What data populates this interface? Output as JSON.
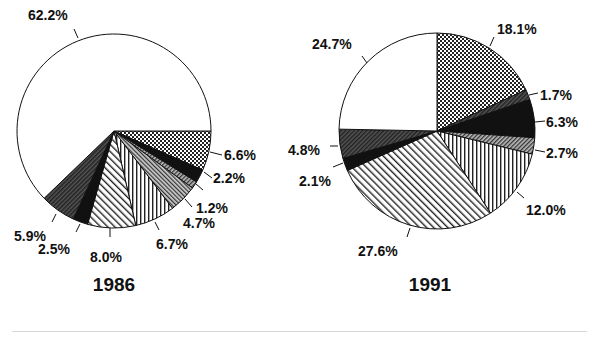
{
  "chart_data": [
    {
      "type": "pie",
      "title": "1986",
      "center": [
        114,
        131
      ],
      "radius": 97,
      "start_angle_deg": 0,
      "direction": "clockwise-from-3-oclock",
      "slices": [
        {
          "label": "6.6%",
          "value": 6.6,
          "pattern": "crosshatch",
          "label_pos": [
            224,
            160
          ],
          "tick": [
            [
              210,
              152
            ],
            [
              222,
              155
            ]
          ]
        },
        {
          "label": "2.2%",
          "value": 2.2,
          "pattern": "black",
          "label_pos": [
            213,
            183
          ],
          "tick": [
            [
              204,
              172
            ],
            [
              212,
              178
            ]
          ]
        },
        {
          "label": "1.2%",
          "value": 1.2,
          "pattern": "dense-diag",
          "label_pos": [
            196,
            213
          ],
          "tick": [
            [
              196,
              184
            ],
            [
              203,
              190
            ]
          ]
        },
        {
          "label": "4.7%",
          "value": 4.7,
          "pattern": "gray-diag",
          "label_pos": [
            183,
            228
          ],
          "tick": [
            [
              185,
              199
            ],
            [
              192,
              207
            ]
          ]
        },
        {
          "label": "6.7%",
          "value": 6.7,
          "pattern": "vertical",
          "label_pos": [
            156,
            249
          ],
          "tick": [
            [
              155,
              222
            ],
            [
              159,
              230
            ]
          ]
        },
        {
          "label": "8.0%",
          "value": 8.0,
          "pattern": "diagonal",
          "label_pos": [
            90,
            262
          ],
          "tick": [
            [
              110,
              228
            ],
            [
              110,
              237
            ]
          ]
        },
        {
          "label": "2.5%",
          "value": 2.5,
          "pattern": "black",
          "label_pos": [
            38,
            254
          ],
          "tick": [
            [
              80,
              224
            ],
            [
              76,
              232
            ]
          ]
        },
        {
          "label": "5.9%",
          "value": 5.9,
          "pattern": "dark-gray",
          "label_pos": [
            14,
            241
          ],
          "tick": [
            [
              56,
              214
            ],
            [
              52,
              222
            ]
          ]
        },
        {
          "label": "62.2%",
          "value": 62.2,
          "pattern": "white",
          "label_pos": [
            28,
            20
          ],
          "tick": [
            [
              74,
              29
            ],
            [
              78,
              38
            ]
          ]
        }
      ]
    },
    {
      "type": "pie",
      "title": "1991",
      "center": [
        437,
        131
      ],
      "radius": 98,
      "start_angle_deg": -90,
      "direction": "clockwise-from-12-oclock",
      "slices": [
        {
          "label": "18.1%",
          "value": 18.1,
          "pattern": "crosshatch",
          "label_pos": [
            497,
            34
          ],
          "tick": [
            [
              494,
              37
            ],
            [
              490,
              46
            ]
          ]
        },
        {
          "label": "1.7%",
          "value": 1.7,
          "pattern": "dark-gray",
          "label_pos": [
            540,
            100
          ],
          "tick": [
            [
              529,
              95
            ],
            [
              538,
              93
            ]
          ]
        },
        {
          "label": "6.3%",
          "value": 6.3,
          "pattern": "black",
          "label_pos": [
            546,
            127
          ],
          "tick": [
            [
              535,
              122
            ],
            [
              545,
              121
            ]
          ]
        },
        {
          "label": "2.7%",
          "value": 2.7,
          "pattern": "dense-diag",
          "label_pos": [
            546,
            158
          ],
          "tick": [
            [
              535,
              150
            ],
            [
              545,
              152
            ]
          ]
        },
        {
          "label": "12.0%",
          "value": 12.0,
          "pattern": "vertical",
          "label_pos": [
            526,
            215
          ],
          "tick": [
            [
              517,
              192
            ],
            [
              524,
              198
            ]
          ]
        },
        {
          "label": "27.6%",
          "value": 27.6,
          "pattern": "diagonal",
          "label_pos": [
            358,
            256
          ],
          "tick": [
            [
              410,
              228
            ],
            [
              407,
              237
            ]
          ]
        },
        {
          "label": "2.1%",
          "value": 2.1,
          "pattern": "black",
          "label_pos": [
            299,
            186
          ],
          "tick": [
            [
              343,
              163
            ],
            [
              333,
              167
            ]
          ]
        },
        {
          "label": "4.8%",
          "value": 4.8,
          "pattern": "dark-gray",
          "label_pos": [
            288,
            155
          ],
          "tick": [
            [
              338,
              146
            ],
            [
              330,
              146
            ]
          ]
        },
        {
          "label": "24.7%",
          "value": 24.7,
          "pattern": "white",
          "label_pos": [
            312,
            49
          ],
          "tick": [
            [
              362,
              56
            ],
            [
              367,
              63
            ]
          ]
        }
      ]
    }
  ],
  "captions": {
    "left": "1986",
    "right": "1991"
  },
  "colors": {
    "ink": "#111111",
    "background": "#ffffff",
    "rule": "#d8d8d8"
  }
}
